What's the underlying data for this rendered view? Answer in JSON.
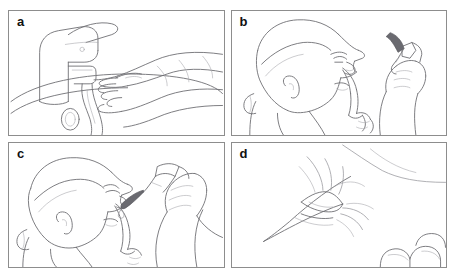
{
  "figure": {
    "type": "instructional-line-art",
    "background_color": "#ffffff",
    "border_color": "#8d8d8d",
    "line_color": "#6e6e72",
    "panel_count": 4,
    "layout": "2x2 grid"
  },
  "panels": [
    {
      "label": "a",
      "name": "panel-a-wash-hands",
      "description": "Two hands being washed under running water from a single-lever mixer tap above a sink basin",
      "elements": [
        "faucet",
        "water-stream",
        "hands",
        "sink-basin",
        "drain"
      ]
    },
    {
      "label": "b",
      "name": "panel-b-tilt-head",
      "description": "Person with head tilted back pulling down the lower eyelid with index finger while holding the dropper bottle above the eye",
      "elements": [
        "head-profile",
        "index-finger",
        "lower-eyelid",
        "dropper-bottle",
        "holding-hand"
      ]
    },
    {
      "label": "c",
      "name": "panel-c-instil-drop",
      "description": "Dropper bottle lowered close to the eye to instil the drop into the conjunctival sac",
      "elements": [
        "head-profile",
        "dropper-bottle",
        "drop",
        "lower-eyelid",
        "holding-hand"
      ]
    },
    {
      "label": "d",
      "name": "panel-d-close-eye",
      "description": "Close-up of the closed eye with eyelashes after the drop, fingertips resting at the lower right",
      "elements": [
        "closed-eye",
        "eyelashes",
        "eyebrow",
        "fingertips"
      ]
    }
  ]
}
